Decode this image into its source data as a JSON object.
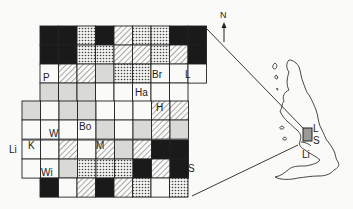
{
  "figure": {
    "type": "grid-map-with-locator",
    "legend_patterns": [
      "black",
      "crosshatch",
      "hatch",
      "grey",
      "white"
    ]
  },
  "grid": {
    "cell_w": 18.5,
    "cell_h": 19.1,
    "rows": [
      {
        "x0": 40,
        "y0": 26,
        "cells": [
          "black",
          "black",
          "cross",
          "black",
          "hatch",
          "cross",
          "cross",
          "black",
          "black"
        ]
      },
      {
        "x0": 40,
        "y0": 45,
        "cells": [
          "black",
          "black",
          "cross",
          "cross",
          "hatch",
          "hatch",
          "cross",
          "hatch",
          "black"
        ]
      },
      {
        "x0": 40,
        "y0": 64,
        "cells": [
          "white",
          "hatch",
          "hatch",
          "grey",
          "cross",
          "cross",
          "white",
          "white",
          "white"
        ]
      },
      {
        "x0": 40,
        "y0": 83,
        "cells": [
          "grey",
          "grey",
          "grey",
          "white",
          "white",
          "white",
          "white",
          "white"
        ]
      },
      {
        "x0": 22,
        "y0": 101,
        "cells": [
          "grey",
          "white",
          "grey",
          "grey",
          "white",
          "white",
          "white",
          "hatch",
          "hatch"
        ]
      },
      {
        "x0": 22,
        "y0": 120,
        "cells": [
          "white",
          "white",
          "white",
          "white",
          "grey",
          "white",
          "grey",
          "hatch",
          "grey"
        ]
      },
      {
        "x0": 22,
        "y0": 140,
        "cells": [
          "white",
          "white",
          "hatch",
          "white",
          "hatch",
          "grey",
          "hatch",
          "black",
          "black"
        ]
      },
      {
        "x0": 22,
        "y0": 159,
        "cells": [
          "white",
          "white",
          "grey",
          "cross",
          "cross",
          "cross",
          "black",
          "hatch",
          "black"
        ]
      },
      {
        "x0": 40,
        "y0": 178,
        "cells": [
          "black",
          "white",
          "hatch",
          "black",
          "hatch",
          "cross",
          "white",
          "cross"
        ]
      }
    ]
  },
  "labels": {
    "P": {
      "text": "P",
      "x": 43,
      "y": 77
    },
    "Br": {
      "text": "Br",
      "x": 153,
      "y": 74
    },
    "L_grid": {
      "text": "L",
      "x": 186,
      "y": 74
    },
    "Ha": {
      "text": "Ha",
      "x": 136,
      "y": 92
    },
    "H": {
      "text": "H",
      "x": 157,
      "y": 104
    },
    "Bo": {
      "text": "Bo",
      "x": 79,
      "y": 123
    },
    "W": {
      "text": "W",
      "x": 49,
      "y": 132
    },
    "Li_grid": {
      "text": "Li",
      "x": 9,
      "y": 146
    },
    "K": {
      "text": "K",
      "x": 28,
      "y": 142
    },
    "M": {
      "text": "M",
      "x": 96,
      "y": 142
    },
    "Wi": {
      "text": "Wi",
      "x": 41,
      "y": 169
    },
    "S_grid": {
      "text": "S",
      "x": 188,
      "y": 168
    },
    "N": {
      "text": "N",
      "x": 222,
      "y": 15
    },
    "L_map": {
      "text": "L",
      "x": 312,
      "y": 126
    },
    "S_map": {
      "text": "S",
      "x": 312,
      "y": 139
    },
    "Li_map": {
      "text": "Li",
      "x": 301,
      "y": 152
    }
  },
  "colors": {
    "ink": "#1a1a1a",
    "grey_fill": "#d9d9d6",
    "paper": "#fafaf8",
    "study_area": "#9a9a96"
  }
}
